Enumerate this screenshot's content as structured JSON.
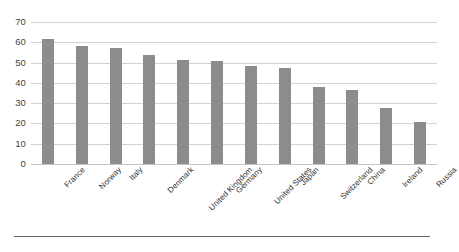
{
  "chart_data": {
    "type": "bar",
    "title": "",
    "subtitle": "",
    "xlabel": "",
    "ylabel": "",
    "categories": [
      "France",
      "Norway",
      "Italy",
      "Denmark",
      "United Kingdom",
      "Germany",
      "United States",
      "Japan",
      "Switzerland",
      "China",
      "Ireland",
      "Russia"
    ],
    "values": [
      61.5,
      58,
      57,
      53.5,
      51.5,
      51,
      48.5,
      47.5,
      38,
      36.5,
      27.5,
      20.5
    ],
    "series": [
      {
        "name": "",
        "values": [
          61.5,
          58,
          57,
          53.5,
          51.5,
          51,
          48.5,
          47.5,
          38,
          36.5,
          27.5,
          20.5
        ]
      }
    ],
    "ylim": [
      0,
      70
    ],
    "ytick_values": [
      0,
      10,
      20,
      30,
      40,
      50,
      60,
      70
    ],
    "ytick_labels": [
      "0",
      "10",
      "20",
      "30",
      "40",
      "50",
      "60",
      "70"
    ],
    "grid": true,
    "grid_axis": "y",
    "legend": false,
    "legend_position": "none",
    "bar_color": "#8c8c8c",
    "gridline_color": "#d3d3d3",
    "axis_text_color": "#3f3f3f",
    "background_color": "#ffffff",
    "xtick_label_rotation": -45,
    "annotations": []
  }
}
